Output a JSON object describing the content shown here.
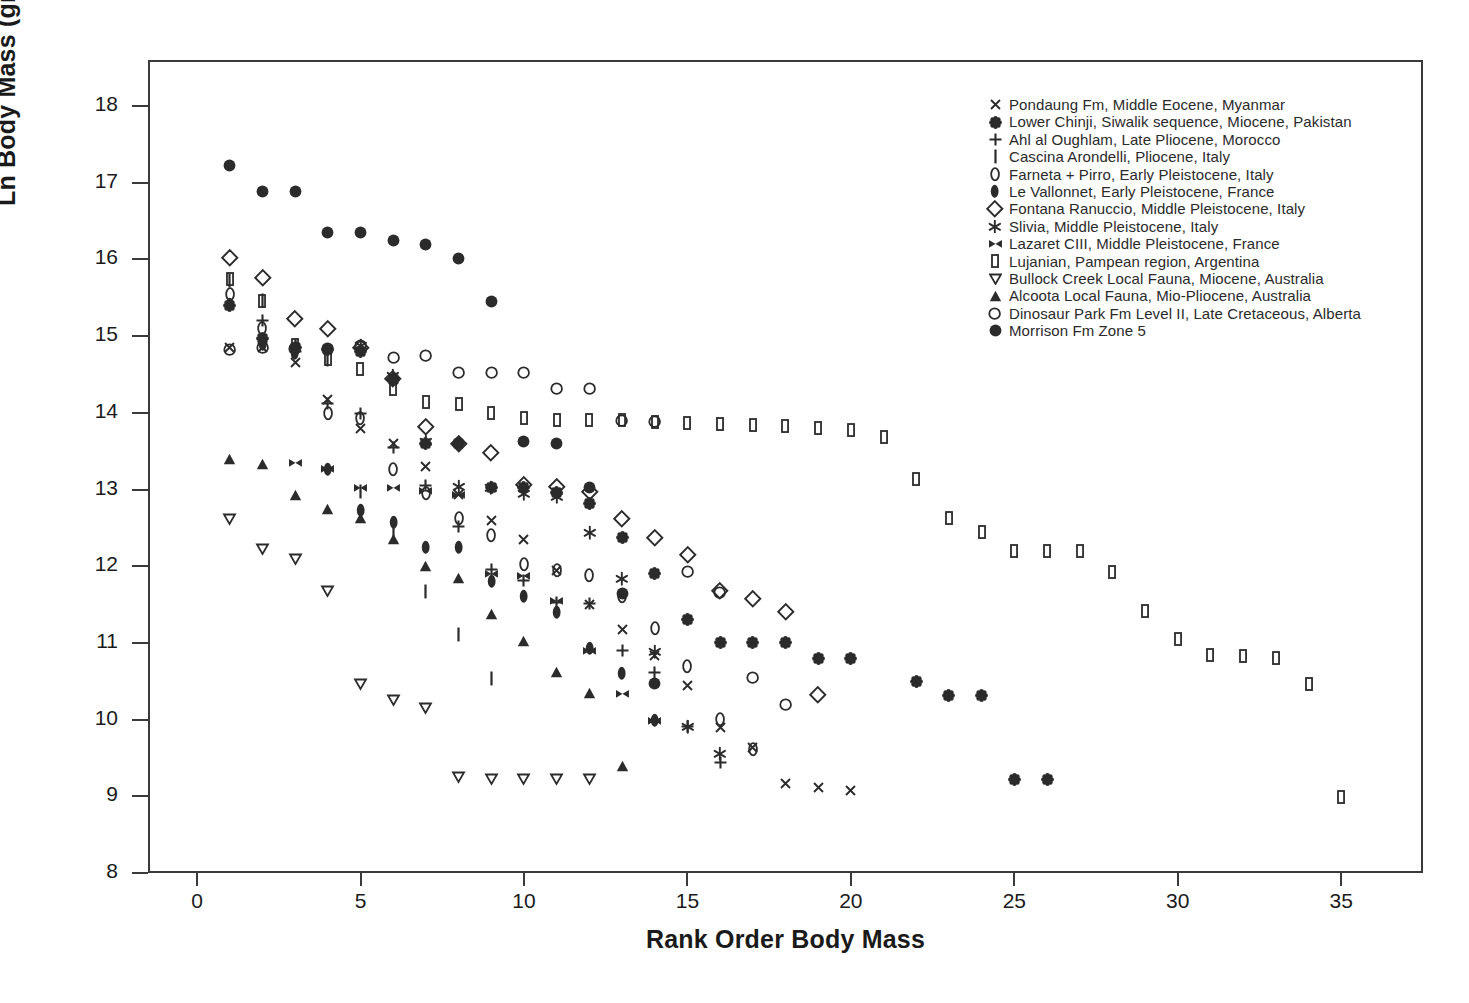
{
  "chart": {
    "type": "scatter",
    "title": "",
    "xlabel": "Rank Order Body Mass",
    "ylabel": "Ln Body Mass (grams)",
    "xlim": [
      -1.5,
      37.5
    ],
    "ylim": [
      8,
      18.6
    ],
    "xticks": [
      0,
      5,
      10,
      15,
      20,
      25,
      30,
      35
    ],
    "yticks": [
      8,
      9,
      10,
      11,
      12,
      13,
      14,
      15,
      16,
      17,
      18
    ],
    "grid": false,
    "legend_position": "top-right",
    "marker_color": "#2b2b2b"
  },
  "legend": {
    "entries": [
      {
        "symbol": "cross-x-icon",
        "label": "Pondaung Fm, Middle Eocene, Myanmar"
      },
      {
        "symbol": "flower-icon",
        "label": "Lower Chinji, Siwalik sequence, Miocene, Pakistan"
      },
      {
        "symbol": "plus-icon",
        "label": "Ahl al Oughlam, Late Pliocene, Morocco"
      },
      {
        "symbol": "vertical-bar-icon",
        "label": "Cascina Arondelli, Pliocene, Italy"
      },
      {
        "symbol": "oval-outline-icon",
        "label": "Farneta + Pirro, Early Pleistocene, Italy"
      },
      {
        "symbol": "oval-filled-icon",
        "label": "Le Vallonnet, Early Pleistocene, France"
      },
      {
        "symbol": "diamond-outline-icon",
        "label": "Fontana Ranuccio, Middle Pleistocene, Italy"
      },
      {
        "symbol": "star-icon",
        "label": "Slivia, Middle Pleistocene, Italy"
      },
      {
        "symbol": "bowtie-icon",
        "label": "Lazaret CIII, Middle Pleistocene, France"
      },
      {
        "symbol": "rect-outline-icon",
        "label": "Lujanian, Pampean region, Argentina"
      },
      {
        "symbol": "triangle-down-icon",
        "label": "Bullock Creek Local Fauna, Miocene, Australia"
      },
      {
        "symbol": "triangle-up-icon",
        "label": "Alcoota Local Fauna, Mio-Pliocene, Australia"
      },
      {
        "symbol": "circle-outline-icon",
        "label": "Dinosaur Park Fm Level II, Late Cretaceous, Alberta"
      },
      {
        "symbol": "circle-filled-icon",
        "label": "Morrison Fm Zone 5"
      }
    ]
  },
  "chart_data": {
    "type": "scatter",
    "title": "",
    "xlabel": "Rank Order Body Mass",
    "ylabel": "Ln Body Mass (grams)",
    "xlim": [
      -1.5,
      37.5
    ],
    "ylim": [
      8,
      18.6
    ],
    "xticks": [
      0,
      5,
      10,
      15,
      20,
      25,
      30,
      35
    ],
    "yticks": [
      8,
      9,
      10,
      11,
      12,
      13,
      14,
      15,
      16,
      17,
      18
    ],
    "grid": false,
    "legend_position": "top-right",
    "series": [
      {
        "name": "Pondaung Fm, Middle Eocene, Myanmar",
        "symbol": "cross-x-icon",
        "x": [
          1,
          2,
          3,
          4,
          5,
          6,
          7,
          8,
          9,
          10,
          11,
          12,
          13,
          14,
          15,
          16,
          17,
          18,
          19,
          20
        ],
        "y": [
          14.85,
          14.85,
          14.65,
          14.17,
          13.79,
          13.6,
          13.3,
          12.94,
          12.59,
          12.35,
          11.95,
          11.5,
          11.18,
          10.83,
          10.45,
          9.9,
          9.63,
          9.17,
          9.11,
          9.08
        ]
      },
      {
        "name": "Lower Chinji, Siwalik sequence, Miocene, Pakistan",
        "symbol": "flower-icon",
        "x": [
          1,
          2,
          3,
          4,
          5,
          6,
          7,
          8,
          9,
          10,
          11,
          12,
          13,
          14,
          15,
          16,
          17,
          18,
          19,
          20,
          22,
          23,
          24,
          25,
          26
        ],
        "y": [
          15.4,
          14.97,
          14.85,
          14.82,
          14.8,
          14.44,
          13.6,
          13.6,
          13.03,
          13.03,
          12.96,
          12.82,
          12.37,
          11.91,
          11.3,
          11.0,
          11.0,
          11.0,
          10.8,
          10.8,
          10.5,
          10.31,
          10.31,
          9.22,
          9.22
        ]
      },
      {
        "name": "Ahl al Oughlam, Late Pliocene, Morocco",
        "symbol": "plus-icon",
        "x": [
          2,
          3,
          4,
          5,
          6,
          7,
          8,
          9,
          10,
          11,
          12,
          13,
          14,
          15,
          16
        ],
        "y": [
          15.2,
          14.8,
          14.12,
          13.99,
          13.55,
          13.05,
          12.52,
          11.96,
          11.81,
          11.53,
          11.52,
          10.9,
          10.62,
          9.91,
          9.44
        ]
      },
      {
        "name": "Cascina Arondelli, Pliocene, Italy",
        "symbol": "vertical-bar-icon",
        "x": [
          1,
          2,
          3,
          4,
          5,
          6,
          7,
          8,
          9
        ],
        "y": [
          15.72,
          15.47,
          14.88,
          14.7,
          12.98,
          12.45,
          11.67,
          11.11,
          10.53
        ]
      },
      {
        "name": "Farneta + Pirro, Early Pleistocene, Italy",
        "symbol": "oval-outline-icon",
        "x": [
          1,
          2,
          3,
          4,
          5,
          6,
          7,
          8,
          9,
          10,
          11,
          12,
          13,
          14,
          15,
          16,
          17
        ],
        "y": [
          15.55,
          15.1,
          14.83,
          14.0,
          13.93,
          13.27,
          12.95,
          12.63,
          12.4,
          12.02,
          11.95,
          11.88,
          11.61,
          11.19,
          10.7,
          10.0,
          9.61
        ]
      },
      {
        "name": "Le Vallonnet, Early Pleistocene, France",
        "symbol": "oval-filled-icon",
        "x": [
          1,
          2,
          3,
          4,
          5,
          6,
          7,
          8,
          9,
          10,
          11,
          12,
          13,
          14
        ],
        "y": [
          15.42,
          14.89,
          14.78,
          13.26,
          12.73,
          12.57,
          12.25,
          12.25,
          11.8,
          11.61,
          11.4,
          10.93,
          10.6,
          9.99
        ]
      },
      {
        "name": "Fontana Ranuccio, Middle Pleistocene, Italy",
        "symbol": "diamond-outline-icon",
        "x": [
          1,
          2,
          3,
          4,
          5,
          6,
          7,
          8,
          9,
          10,
          11,
          12,
          13,
          14,
          15,
          16,
          17,
          18,
          19
        ],
        "y": [
          16.02,
          15.76,
          15.22,
          15.1,
          14.85,
          14.45,
          13.82,
          13.6,
          13.48,
          13.06,
          13.03,
          12.97,
          12.62,
          12.37,
          12.15,
          11.68,
          11.58,
          11.41,
          10.32
        ]
      },
      {
        "name": "Slivia, Middle Pleistocene, Italy",
        "symbol": "star-icon",
        "x": [
          5,
          6,
          7,
          8,
          9,
          10,
          11,
          12,
          13,
          14,
          15,
          16
        ],
        "y": [
          14.87,
          14.48,
          13.62,
          13.03,
          13.02,
          12.95,
          12.9,
          12.43,
          11.84,
          10.89,
          9.9,
          9.55
        ]
      },
      {
        "name": "Lazaret CIII, Middle Pleistocene, France",
        "symbol": "bowtie-icon",
        "x": [
          3,
          4,
          5,
          6,
          7,
          8,
          9,
          10,
          11,
          12,
          13,
          14
        ],
        "y": [
          13.35,
          13.27,
          13.02,
          13.02,
          12.98,
          12.93,
          11.9,
          11.88,
          11.55,
          10.9,
          10.33,
          9.98
        ]
      },
      {
        "name": "Lujanian, Pampean region, Argentina",
        "symbol": "rect-outline-icon",
        "x": [
          1,
          2,
          3,
          4,
          5,
          6,
          7,
          8,
          9,
          10,
          11,
          12,
          13,
          14,
          15,
          16,
          17,
          18,
          19,
          20,
          21,
          22,
          23,
          24,
          25,
          26,
          27,
          28,
          29,
          30,
          31,
          32,
          33,
          34,
          35
        ],
        "y": [
          15.75,
          15.46,
          14.88,
          14.7,
          14.57,
          14.31,
          14.14,
          14.12,
          14.0,
          13.93,
          13.91,
          13.9,
          13.9,
          13.88,
          13.87,
          13.85,
          13.84,
          13.83,
          13.8,
          13.78,
          13.68,
          13.14,
          12.63,
          12.45,
          12.2,
          12.2,
          12.2,
          11.93,
          11.42,
          11.05,
          10.84,
          10.83,
          10.8,
          10.46,
          8.99
        ]
      },
      {
        "name": "Bullock Creek Local Fauna, Miocene, Australia",
        "symbol": "triangle-down-icon",
        "x": [
          1,
          2,
          3,
          4,
          5,
          6,
          7,
          8,
          9,
          10,
          11,
          12
        ],
        "y": [
          12.61,
          12.22,
          12.1,
          11.68,
          10.47,
          10.25,
          10.15,
          9.25,
          9.22,
          9.22,
          9.22,
          9.22
        ]
      },
      {
        "name": "Alcoota Local Fauna, Mio-Pliocene, Australia",
        "symbol": "triangle-up-icon",
        "x": [
          1,
          2,
          3,
          4,
          5,
          6,
          7,
          8,
          9,
          10,
          11,
          12,
          13
        ],
        "y": [
          13.4,
          13.33,
          12.93,
          12.75,
          12.63,
          12.36,
          12.0,
          11.85,
          11.38,
          11.02,
          10.62,
          10.35,
          9.4
        ]
      },
      {
        "name": "Dinosaur Park Fm Level II, Late Cretaceous, Alberta",
        "symbol": "circle-outline-icon",
        "x": [
          1,
          2,
          3,
          4,
          5,
          6,
          7,
          8,
          9,
          10,
          11,
          12,
          13,
          14,
          15,
          16,
          17,
          18
        ],
        "y": [
          14.82,
          14.85,
          14.84,
          14.84,
          14.88,
          14.72,
          14.75,
          14.52,
          14.52,
          14.52,
          14.32,
          14.32,
          13.9,
          13.88,
          11.93,
          11.65,
          10.55,
          10.2
        ]
      },
      {
        "name": "Morrison Fm Zone 5",
        "symbol": "circle-filled-icon",
        "x": [
          1,
          2,
          3,
          4,
          5,
          6,
          7,
          8,
          9,
          10,
          11,
          12,
          13,
          14
        ],
        "y": [
          17.23,
          16.89,
          16.89,
          16.35,
          16.35,
          16.25,
          16.2,
          16.01,
          15.45,
          13.63,
          13.6,
          13.03,
          11.65,
          10.47
        ]
      }
    ]
  }
}
